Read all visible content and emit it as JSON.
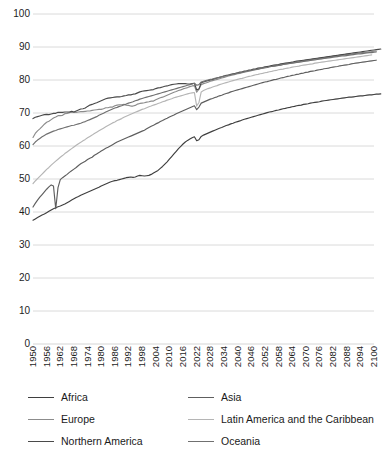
{
  "chart_data": {
    "type": "line",
    "title": "",
    "xlabel": "",
    "ylabel": "",
    "xlim": [
      1950,
      2100
    ],
    "ylim": [
      0,
      100
    ],
    "grid": true,
    "legend_position": "bottom",
    "y_ticks": [
      100,
      90,
      80,
      70,
      60,
      50,
      40,
      30,
      20,
      10,
      0
    ],
    "x_ticks": [
      1950,
      1956,
      1962,
      1968,
      1974,
      1980,
      1986,
      1992,
      1998,
      2004,
      2010,
      2016,
      2022,
      2028,
      2034,
      2040,
      2046,
      2052,
      2058,
      2064,
      2070,
      2076,
      2082,
      2088,
      2094,
      2100
    ],
    "x_step": 1,
    "x_start": 1950,
    "series": [
      {
        "name": "Africa",
        "color": "#3f3f3f",
        "values": [
          37.5,
          37.9,
          38.3,
          38.7,
          39.1,
          39.4,
          39.8,
          40.2,
          40.6,
          41.0,
          41.3,
          41.6,
          41.8,
          42.1,
          42.4,
          42.8,
          43.2,
          43.6,
          44.0,
          44.4,
          44.7,
          45.1,
          45.4,
          45.7,
          46.0,
          46.3,
          46.6,
          46.9,
          47.2,
          47.5,
          47.9,
          48.2,
          48.5,
          48.8,
          49.1,
          49.3,
          49.5,
          49.6,
          49.8,
          50.0,
          50.2,
          50.4,
          50.5,
          50.6,
          50.5,
          50.6,
          50.9,
          51.1,
          51.0,
          50.9,
          51.0,
          51.1,
          51.4,
          51.8,
          52.2,
          52.6,
          53.2,
          53.8,
          54.5,
          55.2,
          56.0,
          56.8,
          57.6,
          58.4,
          59.2,
          59.9,
          60.6,
          61.2,
          61.7,
          62.1,
          62.5,
          62.8,
          61.6,
          61.9,
          62.9,
          63.3,
          63.6,
          63.9,
          64.2,
          64.5,
          64.8,
          65.1,
          65.4,
          65.6,
          65.9,
          66.2,
          66.4,
          66.7,
          66.9,
          67.2,
          67.4,
          67.6,
          67.9,
          68.1,
          68.3,
          68.5,
          68.7,
          68.9,
          69.1,
          69.3,
          69.5,
          69.7,
          69.9,
          70.1,
          70.3,
          70.4,
          70.6,
          70.8,
          70.9,
          71.1,
          71.3,
          71.4,
          71.6,
          71.7,
          71.9,
          72.0,
          72.2,
          72.3,
          72.4,
          72.6,
          72.7,
          72.8,
          73.0,
          73.1,
          73.2,
          73.3,
          73.4,
          73.6,
          73.7,
          73.8,
          73.9,
          74.0,
          74.1,
          74.2,
          74.3,
          74.4,
          74.5,
          74.6,
          74.7,
          74.8,
          74.8,
          74.9,
          75.0,
          75.1,
          75.2,
          75.2,
          75.3,
          75.4,
          75.5,
          75.5,
          75.6,
          75.7,
          75.7,
          75.8
        ]
      },
      {
        "name": "Asia",
        "color": "#5e5e5e",
        "values": [
          41.5,
          42.6,
          43.6,
          44.5,
          45.3,
          46.1,
          46.9,
          47.6,
          48.2,
          47.9,
          41.0,
          47.4,
          49.8,
          50.4,
          50.9,
          51.4,
          52.0,
          52.5,
          53.0,
          53.5,
          54.1,
          54.6,
          55.0,
          55.4,
          55.9,
          56.3,
          56.6,
          57.2,
          57.6,
          58.0,
          58.5,
          58.9,
          59.3,
          59.6,
          60.0,
          60.4,
          60.8,
          61.2,
          61.5,
          61.8,
          62.1,
          62.4,
          62.7,
          63.0,
          63.3,
          63.6,
          63.9,
          64.2,
          64.5,
          64.8,
          65.2,
          65.6,
          66.0,
          66.3,
          66.7,
          67.0,
          67.4,
          67.7,
          68.1,
          68.4,
          68.8,
          69.1,
          69.4,
          69.8,
          70.1,
          70.4,
          70.7,
          71.0,
          71.3,
          71.6,
          71.9,
          72.2,
          71.0,
          71.8,
          73.0,
          73.3,
          73.6,
          73.9,
          74.2,
          74.4,
          74.7,
          74.9,
          75.2,
          75.4,
          75.7,
          75.9,
          76.1,
          76.4,
          76.6,
          76.8,
          77.0,
          77.2,
          77.4,
          77.6,
          77.8,
          78.0,
          78.2,
          78.4,
          78.6,
          78.8,
          79.0,
          79.2,
          79.4,
          79.5,
          79.7,
          79.9,
          80.1,
          80.2,
          80.4,
          80.6,
          80.7,
          80.9,
          81.1,
          81.2,
          81.4,
          81.5,
          81.7,
          81.8,
          82.0,
          82.1,
          82.3,
          82.4,
          82.6,
          82.7,
          82.8,
          83.0,
          83.1,
          83.2,
          83.4,
          83.5,
          83.6,
          83.8,
          83.9,
          84.0,
          84.1,
          84.3,
          84.4,
          84.5,
          84.6,
          84.7,
          84.9,
          85.0,
          85.1,
          85.2,
          85.3,
          85.4,
          85.5,
          85.6,
          85.7,
          85.8,
          85.9,
          86.0
        ]
      },
      {
        "name": "Europe",
        "color": "#8c8c8c",
        "values": [
          62.6,
          63.8,
          64.6,
          65.2,
          65.9,
          66.6,
          67.2,
          67.5,
          68.0,
          68.5,
          68.8,
          69.2,
          69.2,
          69.3,
          69.8,
          69.9,
          70.1,
          70.3,
          70.2,
          70.2,
          70.3,
          70.4,
          70.4,
          70.5,
          70.6,
          70.6,
          70.8,
          70.9,
          71.0,
          71.1,
          71.1,
          71.3,
          71.6,
          71.6,
          71.8,
          71.8,
          72.2,
          72.4,
          72.5,
          72.5,
          72.6,
          72.4,
          72.3,
          72.1,
          72.1,
          72.3,
          72.7,
          72.9,
          73.0,
          73.1,
          73.3,
          73.4,
          73.6,
          73.6,
          74.0,
          74.3,
          74.6,
          74.8,
          75.1,
          75.4,
          75.7,
          76.0,
          76.3,
          76.5,
          76.8,
          77.0,
          77.3,
          77.5,
          77.7,
          78.0,
          78.2,
          78.3,
          76.3,
          77.2,
          78.6,
          78.9,
          79.1,
          79.3,
          79.6,
          79.8,
          80.0,
          80.2,
          80.4,
          80.6,
          80.8,
          81.0,
          81.2,
          81.4,
          81.5,
          81.7,
          81.9,
          82.0,
          82.2,
          82.4,
          82.5,
          82.7,
          82.8,
          83.0,
          83.1,
          83.3,
          83.4,
          83.6,
          83.7,
          83.8,
          84.0,
          84.1,
          84.2,
          84.4,
          84.5,
          84.6,
          84.7,
          84.9,
          85.0,
          85.1,
          85.2,
          85.3,
          85.4,
          85.5,
          85.7,
          85.8,
          85.9,
          86.0,
          86.1,
          86.2,
          86.3,
          86.4,
          86.5,
          86.6,
          86.7,
          86.8,
          86.9,
          87.0,
          87.1,
          87.2,
          87.3,
          87.4,
          87.5,
          87.6,
          87.7,
          87.7,
          87.8,
          87.9,
          88.0,
          88.1,
          88.2,
          88.3,
          88.3,
          88.4,
          88.5,
          88.6,
          88.7,
          88.8
        ]
      },
      {
        "name": "Latin America and the Caribbean",
        "color": "#b5b5b5",
        "values": [
          48.6,
          49.4,
          50.1,
          50.8,
          51.5,
          52.2,
          52.9,
          53.5,
          54.2,
          54.8,
          55.4,
          56.0,
          56.6,
          57.1,
          57.7,
          58.2,
          58.7,
          59.2,
          59.7,
          60.2,
          60.7,
          61.1,
          61.6,
          62.0,
          62.5,
          62.9,
          63.3,
          63.8,
          64.2,
          64.6,
          65.0,
          65.4,
          65.8,
          66.2,
          66.6,
          67.0,
          67.3,
          67.7,
          68.0,
          68.3,
          68.7,
          69.0,
          69.3,
          69.6,
          69.9,
          70.2,
          70.5,
          70.8,
          71.1,
          71.3,
          71.6,
          71.9,
          72.1,
          72.4,
          72.6,
          72.9,
          73.1,
          73.4,
          73.6,
          73.9,
          74.1,
          74.3,
          74.6,
          74.8,
          75.0,
          75.2,
          75.4,
          75.6,
          75.8,
          76.0,
          76.1,
          76.2,
          72.1,
          73.2,
          76.4,
          76.8,
          77.1,
          77.4,
          77.6,
          77.9,
          78.1,
          78.3,
          78.6,
          78.8,
          79.0,
          79.2,
          79.4,
          79.6,
          79.8,
          80.0,
          80.2,
          80.4,
          80.5,
          80.7,
          80.9,
          81.1,
          81.2,
          81.4,
          81.6,
          81.7,
          81.9,
          82.0,
          82.2,
          82.3,
          82.5,
          82.6,
          82.8,
          82.9,
          83.1,
          83.2,
          83.3,
          83.5,
          83.6,
          83.7,
          83.9,
          84.0,
          84.1,
          84.2,
          84.4,
          84.5,
          84.6,
          84.7,
          84.8,
          84.9,
          85.1,
          85.2,
          85.3,
          85.4,
          85.5,
          85.6,
          85.7,
          85.8,
          85.9,
          86.0,
          86.1,
          86.2,
          86.3,
          86.4,
          86.5,
          86.6,
          86.7,
          86.8,
          86.9,
          87.0,
          87.1,
          87.2,
          87.3,
          87.4,
          87.5,
          87.6
        ]
      },
      {
        "name": "Northern America",
        "color": "#4a4a4a",
        "values": [
          68.3,
          68.7,
          68.9,
          69.1,
          69.3,
          69.5,
          69.6,
          69.5,
          69.7,
          69.9,
          69.9,
          70.2,
          70.2,
          70.2,
          70.3,
          70.3,
          70.3,
          70.5,
          70.3,
          70.6,
          70.9,
          71.2,
          71.3,
          71.5,
          72.0,
          72.4,
          72.6,
          72.9,
          73.1,
          73.4,
          73.7,
          74.0,
          74.3,
          74.5,
          74.6,
          74.7,
          74.8,
          74.9,
          74.9,
          75.0,
          75.2,
          75.3,
          75.5,
          75.5,
          75.7,
          75.8,
          76.1,
          76.4,
          76.6,
          76.7,
          76.8,
          76.9,
          77.0,
          77.1,
          77.4,
          77.6,
          77.7,
          77.9,
          78.1,
          78.2,
          78.4,
          78.6,
          78.7,
          78.8,
          78.9,
          78.9,
          78.9,
          78.9,
          78.8,
          78.8,
          78.9,
          79.0,
          77.0,
          77.3,
          79.2,
          79.4,
          79.6,
          79.8,
          80.0,
          80.2,
          80.4,
          80.6,
          80.8,
          81.0,
          81.2,
          81.4,
          81.5,
          81.7,
          81.9,
          82.0,
          82.2,
          82.4,
          82.5,
          82.7,
          82.8,
          83.0,
          83.1,
          83.3,
          83.4,
          83.6,
          83.7,
          83.8,
          84.0,
          84.1,
          84.2,
          84.4,
          84.5,
          84.6,
          84.7,
          84.9,
          85.0,
          85.1,
          85.2,
          85.3,
          85.4,
          85.6,
          85.7,
          85.8,
          85.9,
          86.0,
          86.1,
          86.2,
          86.3,
          86.4,
          86.5,
          86.6,
          86.7,
          86.8,
          86.9,
          87.0,
          87.1,
          87.2,
          87.3,
          87.4,
          87.5,
          87.6,
          87.7,
          87.8,
          87.9,
          88.0,
          88.1,
          88.2,
          88.3,
          88.4,
          88.5,
          88.6,
          88.7,
          88.8,
          88.9,
          89.0,
          89.1,
          89.2,
          89.3,
          89.4
        ]
      },
      {
        "name": "Oceania",
        "color": "#707070",
        "values": [
          60.4,
          61.2,
          61.8,
          62.3,
          62.8,
          63.2,
          63.6,
          63.9,
          64.2,
          64.5,
          64.7,
          65.0,
          65.2,
          65.4,
          65.6,
          65.8,
          66.0,
          66.2,
          66.3,
          66.5,
          66.7,
          66.9,
          67.2,
          67.4,
          67.7,
          68.0,
          68.3,
          68.6,
          68.9,
          69.3,
          69.6,
          69.9,
          70.3,
          70.6,
          70.9,
          71.2,
          71.5,
          71.7,
          72.0,
          72.2,
          72.5,
          72.7,
          73.0,
          73.2,
          73.4,
          73.7,
          73.9,
          74.2,
          74.4,
          74.6,
          74.8,
          75.0,
          75.2,
          75.4,
          75.6,
          75.8,
          76.0,
          76.2,
          76.4,
          76.6,
          76.8,
          77.0,
          77.2,
          77.4,
          77.6,
          77.8,
          78.0,
          78.2,
          78.4,
          78.6,
          78.8,
          79.0,
          78.4,
          78.6,
          79.4,
          79.6,
          79.8,
          80.0,
          80.2,
          80.3,
          80.5,
          80.7,
          80.8,
          81.0,
          81.2,
          81.3,
          81.5,
          81.6,
          81.8,
          81.9,
          82.1,
          82.2,
          82.4,
          82.5,
          82.7,
          82.8,
          82.9,
          83.1,
          83.2,
          83.3,
          83.5,
          83.6,
          83.7,
          83.8,
          84.0,
          84.1,
          84.2,
          84.3,
          84.4,
          84.5,
          84.7,
          84.8,
          84.9,
          85.0,
          85.1,
          85.2,
          85.3,
          85.4,
          85.5,
          85.6,
          85.7,
          85.8,
          85.9,
          86.0,
          86.1,
          86.2,
          86.3,
          86.4,
          86.5,
          86.6,
          86.7,
          86.8,
          86.9,
          87.0,
          87.1,
          87.2,
          87.3,
          87.3,
          87.4,
          87.5,
          87.6,
          87.7,
          87.8,
          87.9,
          87.9,
          88.0,
          88.1,
          88.2,
          88.3,
          88.3,
          88.4,
          88.5
        ]
      }
    ]
  },
  "legend": {
    "items": [
      {
        "label": "Africa",
        "color": "#3f3f3f"
      },
      {
        "label": "Asia",
        "color": "#5e5e5e"
      },
      {
        "label": "Europe",
        "color": "#8c8c8c"
      },
      {
        "label": "Latin America and the Caribbean",
        "color": "#b5b5b5"
      },
      {
        "label": "Northern America",
        "color": "#4a4a4a"
      },
      {
        "label": "Oceania",
        "color": "#707070"
      }
    ]
  },
  "style": {
    "grid_color": "#d0d0d0",
    "text_color": "#1a1a1a",
    "background": "#ffffff"
  }
}
